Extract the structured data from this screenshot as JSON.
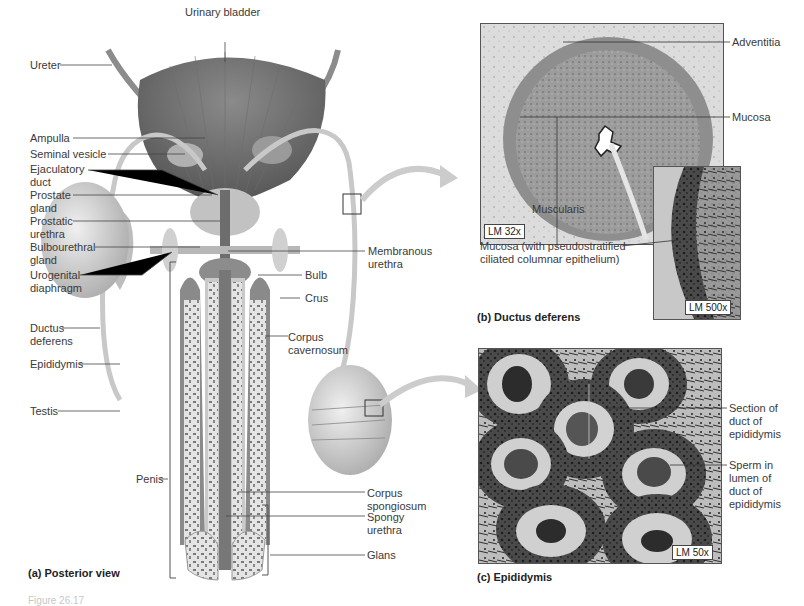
{
  "figure": {
    "panel_a": {
      "caption": "(a) Posterior view",
      "labels": {
        "urinary_bladder": "Urinary bladder",
        "ureter": "Ureter",
        "ampulla": "Ampulla",
        "seminal_vesicle": "Seminal vesicle",
        "ejaculatory_duct": "Ejaculatory\nduct",
        "prostate_gland": "Prostate\ngland",
        "prostatic_urethra": "Prostatic\nurethra",
        "bulbourethral_gland": "Bulbourethral\ngland",
        "urogenital_diaphragm": "Urogenital\ndiaphragm",
        "ductus_deferens": "Ductus\ndeferens",
        "epididymis": "Epididymis",
        "testis": "Testis",
        "penis": "Penis",
        "membranous_urethra": "Membranous\nurethra",
        "bulb": "Bulb",
        "crus": "Crus",
        "corpus_cavernosum": "Corpus\ncavernosum",
        "corpus_spongiosum": "Corpus\nspongiosum",
        "spongy_urethra": "Spongy\nurethra",
        "glans": "Glans"
      }
    },
    "panel_b": {
      "caption": "(b) Ductus deferens",
      "labels": {
        "adventitia": "Adventitia",
        "mucosa": "Mucosa",
        "muscularis": "Muscularis",
        "mucosa_detail": "Mucosa (with pseudostratified\nciliated columnar epithelium)"
      },
      "magnification_low": "LM 32x",
      "magnification_high": "LM 500x"
    },
    "panel_c": {
      "caption": "(c) Epididymis",
      "labels": {
        "section_of_duct": "Section of\nduct of\nepididymis",
        "sperm_in_lumen": "Sperm in\nlumen of\nduct of\nepididymis"
      },
      "magnification": "LM 50x"
    },
    "footer_caption": "Figure 26.17"
  }
}
